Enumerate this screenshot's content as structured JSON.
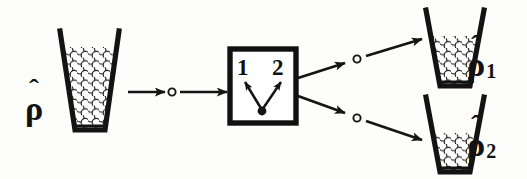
{
  "figure": {
    "background_color": "#fdfdfc",
    "ink_color": "#121212",
    "width": 527,
    "height": 179
  },
  "labels": {
    "input_rho": {
      "symbol": "ρ",
      "hat": "̂",
      "subscript": ""
    },
    "output_rho_1": {
      "symbol": "ρ",
      "hat": "̂",
      "subscript": "1"
    },
    "output_rho_2": {
      "symbol": "ρ",
      "hat": "̂",
      "subscript": "2"
    }
  },
  "measurement_box": {
    "outcome_left": "1",
    "outcome_right": "2",
    "border_color": "#111111"
  },
  "beakers": [
    {
      "name": "input-beaker",
      "label_key": "input_rho",
      "fill_fraction": 0.86
    },
    {
      "name": "output-beaker-upper",
      "label_key": "output_rho_1",
      "fill_fraction": 0.68
    },
    {
      "name": "output-beaker-lower",
      "label_key": "output_rho_2",
      "fill_fraction": 0.5
    }
  ],
  "flow": {
    "input_channel": "input-arrow",
    "upper_channel": "upper-output-arrow",
    "lower_channel": "lower-output-arrow",
    "node_marker": "open-circle"
  },
  "icons": {
    "arrow": "arrow-icon",
    "node": "circle-node-icon",
    "beaker": "beaker-icon",
    "branch": "branching-arrows-icon"
  }
}
